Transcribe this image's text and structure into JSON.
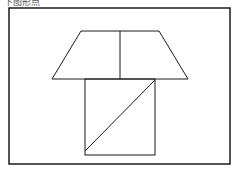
{
  "caption": "下图形点",
  "diagram": {
    "stroke_color": "#1a1a1a",
    "frame": {
      "x": 9,
      "y": 8,
      "width": 221,
      "height": 156
    },
    "trapezoid": {
      "points": "81,31 159,31 188,79 52,79"
    },
    "trapezoid_divider": {
      "x1": 120,
      "y1": 31,
      "x2": 120,
      "y2": 79
    },
    "square": {
      "x": 85,
      "y": 79,
      "width": 70,
      "height": 76
    },
    "square_diagonal": {
      "x1": 85,
      "y1": 151,
      "x2": 155,
      "y2": 80
    }
  }
}
